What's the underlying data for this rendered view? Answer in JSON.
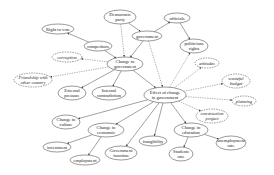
{
  "diagram": {
    "nodes": [
      {
        "id": "democratic_party",
        "lines": [
          "Democratic",
          "party"
        ],
        "x": 120,
        "y": 17,
        "rx": 16,
        "ry": 7,
        "style": "solid"
      },
      {
        "id": "officials",
        "lines": [
          "officials"
        ],
        "x": 177,
        "y": 18,
        "rx": 13,
        "ry": 5,
        "style": "solid"
      },
      {
        "id": "right_to_vote",
        "lines": [
          "Right to vote"
        ],
        "x": 58,
        "y": 29,
        "rx": 16,
        "ry": 5,
        "style": "solid"
      },
      {
        "id": "government",
        "lines": [
          "government"
        ],
        "x": 147,
        "y": 36,
        "rx": 15,
        "ry": 5,
        "style": "solid"
      },
      {
        "id": "competitors",
        "lines": [
          "competitors"
        ],
        "x": 98,
        "y": 46,
        "rx": 14,
        "ry": 5,
        "style": "solid"
      },
      {
        "id": "politicians_rights",
        "lines": [
          "politicians",
          "rights"
        ],
        "x": 194,
        "y": 46,
        "rx": 14,
        "ry": 7,
        "style": "solid"
      },
      {
        "id": "corruption",
        "lines": [
          "corruption"
        ],
        "x": 67,
        "y": 57,
        "rx": 15,
        "ry": 5,
        "style": "dashed"
      },
      {
        "id": "change_to_government",
        "lines": [
          "Change to",
          "government"
        ],
        "x": 125,
        "y": 64,
        "rx": 18,
        "ry": 7,
        "style": "solid"
      },
      {
        "id": "attitudes",
        "lines": [
          "attitudes"
        ],
        "x": 207,
        "y": 63,
        "rx": 12,
        "ry": 5,
        "style": "dashed"
      },
      {
        "id": "friendship",
        "lines": [
          "Friendship with",
          "other country"
        ],
        "x": 33,
        "y": 80,
        "rx": 19,
        "ry": 7,
        "style": "dashed"
      },
      {
        "id": "wasteful_budget",
        "lines": [
          "wasteful",
          "budget"
        ],
        "x": 236,
        "y": 81,
        "rx": 14,
        "ry": 7,
        "style": "dashed"
      },
      {
        "id": "external_pressure",
        "lines": [
          "External",
          "pressure"
        ],
        "x": 72,
        "y": 93,
        "rx": 14,
        "ry": 7,
        "style": "solid"
      },
      {
        "id": "internal_contradiction",
        "lines": [
          "Internal",
          "contradiction"
        ],
        "x": 109,
        "y": 93,
        "rx": 17,
        "ry": 7,
        "style": "solid"
      },
      {
        "id": "effect_of_change",
        "lines": [
          "Effect of change",
          "in government"
        ],
        "x": 165,
        "y": 95,
        "rx": 21,
        "ry": 8,
        "style": "solid"
      },
      {
        "id": "planning",
        "lines": [
          "planning"
        ],
        "x": 244,
        "y": 101,
        "rx": 12,
        "ry": 5,
        "style": "dashed"
      },
      {
        "id": "construction_project",
        "lines": [
          "construction",
          "project"
        ],
        "x": 212,
        "y": 116,
        "rx": 16,
        "ry": 7,
        "style": "dashed"
      },
      {
        "id": "change_in_culture",
        "lines": [
          "Change in",
          "culture"
        ],
        "x": 66,
        "y": 122,
        "rx": 14,
        "ry": 7,
        "style": "solid"
      },
      {
        "id": "change_in_economic",
        "lines": [
          "Change in",
          "economic"
        ],
        "x": 106,
        "y": 130,
        "rx": 18,
        "ry": 7,
        "style": "solid"
      },
      {
        "id": "change_in_education",
        "lines": [
          "Change in",
          "education"
        ],
        "x": 191,
        "y": 130,
        "rx": 17,
        "ry": 7,
        "style": "solid"
      },
      {
        "id": "frangibility",
        "lines": [
          "frangibility"
        ],
        "x": 153,
        "y": 141,
        "rx": 14,
        "ry": 5,
        "style": "solid"
      },
      {
        "id": "unemployment_rate",
        "lines": [
          "unemployment",
          "rate"
        ],
        "x": 231,
        "y": 143,
        "rx": 15,
        "ry": 7,
        "style": "solid"
      },
      {
        "id": "investment",
        "lines": [
          "investment"
        ],
        "x": 57,
        "y": 147,
        "rx": 14,
        "ry": 5,
        "style": "solid"
      },
      {
        "id": "government_function",
        "lines": [
          "Government",
          "function"
        ],
        "x": 121,
        "y": 153,
        "rx": 16,
        "ry": 7,
        "style": "solid"
      },
      {
        "id": "students_rate",
        "lines": [
          "Students",
          "rate"
        ],
        "x": 181,
        "y": 154,
        "rx": 12,
        "ry": 7,
        "style": "solid"
      },
      {
        "id": "employment",
        "lines": [
          "employment"
        ],
        "x": 85,
        "y": 160,
        "rx": 15,
        "ry": 5,
        "style": "solid"
      }
    ],
    "edges": [
      {
        "from": "competitors",
        "to": "right_to_vote",
        "style": "solid"
      },
      {
        "from": "democratic_party",
        "to": "government",
        "style": "solid"
      },
      {
        "from": "government",
        "to": "officials",
        "style": "solid"
      },
      {
        "from": "officials",
        "to": "politicians_rights",
        "style": "solid"
      },
      {
        "from": "democratic_party",
        "to": "change_to_government",
        "style": "dashed"
      },
      {
        "from": "government",
        "to": "change_to_government",
        "style": "solid"
      },
      {
        "from": "competitors",
        "to": "change_to_government",
        "style": "solid"
      },
      {
        "from": "change_to_government",
        "to": "corruption",
        "style": "dashed"
      },
      {
        "from": "change_to_government",
        "to": "friendship",
        "style": "dashed"
      },
      {
        "from": "change_to_government",
        "to": "external_pressure",
        "style": "solid"
      },
      {
        "from": "change_to_government",
        "to": "internal_contradiction",
        "style": "solid"
      },
      {
        "from": "change_to_government",
        "to": "effect_of_change",
        "style": "solid"
      },
      {
        "from": "government",
        "to": "effect_of_change",
        "style": "dashed"
      },
      {
        "from": "effect_of_change",
        "to": "politicians_rights",
        "style": "dashed"
      },
      {
        "from": "effect_of_change",
        "to": "attitudes",
        "style": "dashed"
      },
      {
        "from": "effect_of_change",
        "to": "wasteful_budget",
        "style": "dashed"
      },
      {
        "from": "effect_of_change",
        "to": "planning",
        "style": "dashed"
      },
      {
        "from": "effect_of_change",
        "to": "construction_project",
        "style": "dashed"
      },
      {
        "from": "effect_of_change",
        "to": "change_in_culture",
        "style": "solid"
      },
      {
        "from": "effect_of_change",
        "to": "change_in_economic",
        "style": "solid"
      },
      {
        "from": "effect_of_change",
        "to": "government_function",
        "style": "solid"
      },
      {
        "from": "effect_of_change",
        "to": "frangibility",
        "style": "solid"
      },
      {
        "from": "effect_of_change",
        "to": "change_in_education",
        "style": "solid"
      },
      {
        "from": "change_in_economic",
        "to": "investment",
        "style": "solid"
      },
      {
        "from": "change_in_economic",
        "to": "employment",
        "style": "solid"
      },
      {
        "from": "change_in_education",
        "to": "students_rate",
        "style": "solid"
      },
      {
        "from": "change_in_education",
        "to": "unemployment_rate",
        "style": "solid"
      }
    ]
  }
}
